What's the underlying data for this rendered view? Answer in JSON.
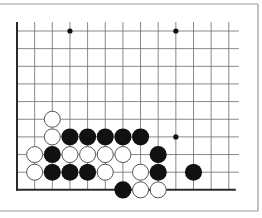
{
  "diagram": {
    "type": "go-board-fragment",
    "colors": {
      "background": "#ffffff",
      "grid_line": "#6a6a6a",
      "edge_line": "#2a2a2a",
      "frame": "#9a9a9a",
      "black_stone": "#111111",
      "white_stone_fill": "#ffffff",
      "white_stone_stroke": "#555555"
    },
    "grid": {
      "x0": 17,
      "y0": 31,
      "spacing_x": 17.65,
      "spacing_y": 17.65,
      "columns": 13,
      "rows": 10,
      "left_edge": true,
      "bottom_edge": true,
      "top_edge": false,
      "right_edge": false
    },
    "star_points": [
      {
        "col": 3,
        "row": 0
      },
      {
        "col": 9,
        "row": 0
      },
      {
        "col": 9,
        "row": 6
      }
    ],
    "stones": [
      {
        "color": "white",
        "col": 2,
        "row": 5
      },
      {
        "color": "white",
        "col": 2,
        "row": 6
      },
      {
        "color": "black",
        "col": 3,
        "row": 6
      },
      {
        "color": "black",
        "col": 4,
        "row": 6
      },
      {
        "color": "black",
        "col": 5,
        "row": 6
      },
      {
        "color": "black",
        "col": 6,
        "row": 6
      },
      {
        "color": "black",
        "col": 7,
        "row": 6
      },
      {
        "color": "white",
        "col": 1,
        "row": 7
      },
      {
        "color": "black",
        "col": 2,
        "row": 7
      },
      {
        "color": "white",
        "col": 3,
        "row": 7
      },
      {
        "color": "white",
        "col": 4,
        "row": 7
      },
      {
        "color": "white",
        "col": 5,
        "row": 7
      },
      {
        "color": "white",
        "col": 6,
        "row": 7
      },
      {
        "color": "black",
        "col": 8,
        "row": 7
      },
      {
        "color": "white",
        "col": 1,
        "row": 8
      },
      {
        "color": "black",
        "col": 2,
        "row": 8
      },
      {
        "color": "black",
        "col": 3,
        "row": 8
      },
      {
        "color": "black",
        "col": 4,
        "row": 8
      },
      {
        "color": "white",
        "col": 5,
        "row": 8
      },
      {
        "color": "white",
        "col": 7,
        "row": 8
      },
      {
        "color": "black",
        "col": 8,
        "row": 8
      },
      {
        "color": "black",
        "col": 10,
        "row": 8
      },
      {
        "color": "black",
        "col": 6,
        "row": 9
      },
      {
        "color": "white",
        "col": 7,
        "row": 9
      },
      {
        "color": "white",
        "col": 8,
        "row": 9
      }
    ]
  }
}
